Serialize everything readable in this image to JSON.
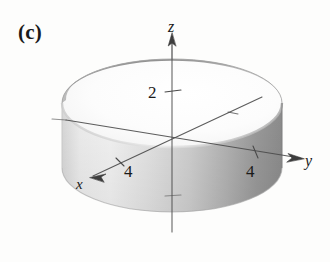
{
  "figure": {
    "panel_label": "(c)",
    "background_color": "#fdfdfc",
    "ink_color": "#3a3a3a",
    "text_color": "#1a1a1a"
  },
  "axes": {
    "z": {
      "name": "z",
      "label": "z",
      "tick_label": "2",
      "arrow": "up"
    },
    "y": {
      "name": "y",
      "label": "y",
      "tick_label": "4",
      "arrow": "right-down-right"
    },
    "x": {
      "name": "x",
      "label": "x",
      "tick_label": "4",
      "arrow": "lower-left"
    },
    "origin": {
      "x": 172,
      "y": 146
    }
  },
  "solid": {
    "name": "cylinder",
    "radius_label": "4",
    "height_label": "2",
    "colors": {
      "top_opening": "#fbfbfa",
      "inner_wall_dark": "#8d8d8d",
      "inner_wall_mid": "#adadad",
      "outer_wall_light": "#ededed",
      "outer_wall_mid": "#c9c9c9",
      "outer_wall_dark": "#8f8f8f",
      "rim_stroke": "#8a8a8a"
    }
  }
}
